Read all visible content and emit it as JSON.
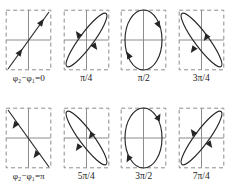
{
  "figure": {
    "title": "",
    "rows": 2,
    "columns": 4,
    "stroke_color": "#262626",
    "axis_color": "#8c8c8c",
    "box_border_color": "#8c8c8c",
    "box_border_style": "dashed",
    "background": "#ffffff"
  },
  "panels": [
    {
      "id": "panel-phase-0",
      "caption_prefix": "φ",
      "caption_sub1": "2",
      "caption_minus": "−",
      "caption_phi2": "φ",
      "caption_sub2": "1",
      "caption_equals": "=0",
      "caption_full": "φ₂−φ₁=0",
      "phase_label": "0",
      "phase_value_rad": 0.0,
      "shape": "line",
      "slope": "positive",
      "direction": "up-right",
      "ellipse_width_ratio": 0.0,
      "tilt_deg": 45,
      "arrow_count": 2
    },
    {
      "id": "panel-phase-pi-over-4",
      "caption_full": "π/4",
      "phase_label": "π/4",
      "phase_value_rad": 0.785,
      "shape": "ellipse",
      "slope": "positive",
      "direction": "clockwise",
      "ellipse_width_ratio": 0.38,
      "tilt_deg": 45,
      "arrow_count": 2
    },
    {
      "id": "panel-phase-pi-over-2",
      "caption_full": "π/2",
      "phase_label": "π/2",
      "phase_value_rad": 1.571,
      "shape": "ellipse",
      "slope": "none",
      "direction": "clockwise",
      "ellipse_width_ratio": 0.82,
      "tilt_deg": 0,
      "arrow_count": 2
    },
    {
      "id": "panel-phase-3pi-over-4",
      "caption_full": "3π/4",
      "phase_label": "3π/4",
      "phase_value_rad": 2.356,
      "shape": "ellipse",
      "slope": "negative",
      "direction": "clockwise",
      "ellipse_width_ratio": 0.38,
      "tilt_deg": -45,
      "arrow_count": 2
    },
    {
      "id": "panel-phase-pi",
      "caption_prefix": "φ",
      "caption_sub1": "2",
      "caption_minus": "−",
      "caption_phi2": "φ",
      "caption_sub2": "1",
      "caption_equals": "=π",
      "caption_full": "φ₂−φ₁=π",
      "phase_label": "π",
      "phase_value_rad": 3.142,
      "shape": "line",
      "slope": "negative",
      "direction": "down-right",
      "ellipse_width_ratio": 0.0,
      "tilt_deg": -45,
      "arrow_count": 2
    },
    {
      "id": "panel-phase-5pi-over-4",
      "caption_full": "5π/4",
      "phase_label": "5π/4",
      "phase_value_rad": 3.927,
      "shape": "ellipse",
      "slope": "negative",
      "direction": "counterclockwise",
      "ellipse_width_ratio": 0.38,
      "tilt_deg": -45,
      "arrow_count": 2
    },
    {
      "id": "panel-phase-3pi-over-2",
      "caption_full": "3π/2",
      "phase_label": "3π/2",
      "phase_value_rad": 4.712,
      "shape": "ellipse",
      "slope": "none",
      "direction": "counterclockwise",
      "ellipse_width_ratio": 0.82,
      "tilt_deg": 0,
      "arrow_count": 2
    },
    {
      "id": "panel-phase-7pi-over-4",
      "caption_full": "7π/4",
      "phase_label": "7π/4",
      "phase_value_rad": 5.498,
      "shape": "ellipse",
      "slope": "positive",
      "direction": "counterclockwise",
      "ellipse_width_ratio": 0.38,
      "tilt_deg": 45,
      "arrow_count": 2
    }
  ]
}
